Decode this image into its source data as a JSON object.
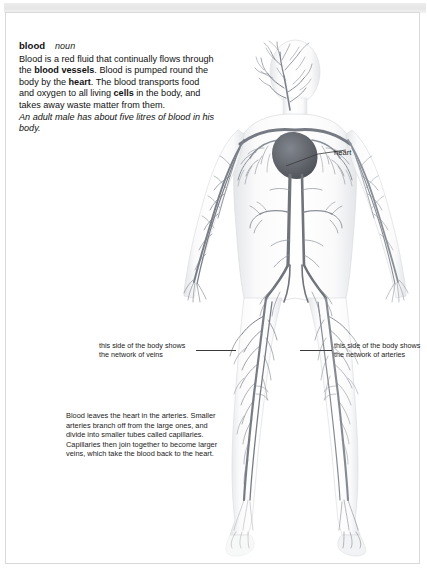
{
  "page": {
    "background_color": "#ffffff",
    "frame_color": "#d9d9d9",
    "top_band_color": "#ececec"
  },
  "entry": {
    "headword": "blood",
    "part_of_speech": "noun",
    "definition_runs": [
      {
        "text": "Blood is a red fluid that continually flows through the ",
        "bold": false
      },
      {
        "text": "blood vessels",
        "bold": true
      },
      {
        "text": ". Blood is pumped round the body by the ",
        "bold": false
      },
      {
        "text": "heart",
        "bold": true
      },
      {
        "text": ". The blood transports food and oxygen to all living ",
        "bold": false
      },
      {
        "text": "cells",
        "bold": true
      },
      {
        "text": " in the body, and takes away waste matter from them.",
        "bold": false
      }
    ],
    "definition_plain": "Blood is a red fluid that continually flows through the blood vessels. Blood is pumped round the body by the heart. The blood transports food and oxygen to all living cells in the body, and takes away waste matter from them.",
    "example": "An adult male has about five litres of blood in his body."
  },
  "labels": {
    "heart": "heart",
    "veins_side": "this side of the body shows the network of veins",
    "veins_side_line1": "this side of the body shows",
    "veins_side_line2": "the network of veins",
    "arteries_side": "this side of the body shows the network of arteries",
    "arteries_side_line1": "this side of the body shows",
    "arteries_side_line2": "the network of arteries"
  },
  "bottom_note": {
    "text": "Blood leaves the heart in the arteries. Smaller arteries branch off from the large ones, and divide into smaller tubes called capillaries. Capillaries then join together to become larger veins, which take the blood back to the heart."
  },
  "figure": {
    "caption_semantic": "human-circulatory-system-diagram",
    "colors": {
      "vessel_dark": "#6f737a",
      "vessel_mid": "#8e939b",
      "vessel_light": "#b3b8bf",
      "body_fill": "#fbfbfc",
      "body_shade": "#e9eaec",
      "heart": "#5d6168",
      "organ": "#9aa0a7"
    }
  }
}
